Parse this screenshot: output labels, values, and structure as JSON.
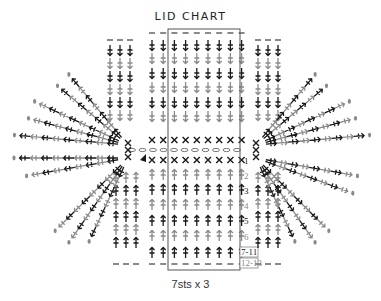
{
  "title": "LID CHART",
  "caption": "7sts x 3",
  "colors": {
    "dark": "#1a1a1a",
    "light": "#8a8a8a",
    "box": "#555555",
    "chain": "#777777"
  },
  "row_labels": [
    {
      "label": "1",
      "shade": "dark"
    },
    {
      "label": "2",
      "shade": "light"
    },
    {
      "label": "3",
      "shade": "dark"
    },
    {
      "label": "4",
      "shade": "light"
    },
    {
      "label": "5",
      "shade": "dark"
    },
    {
      "label": "6",
      "shade": "light"
    }
  ],
  "boxed_labels": [
    "7-11",
    "12-13"
  ],
  "legend_symbols": [
    "chain-oval",
    "single-crochet-x",
    "double-crochet-arrow",
    "slip-stitch",
    "turning-chain-dash"
  ],
  "repeat_box": {
    "stitches": 7,
    "repeats": 3
  }
}
